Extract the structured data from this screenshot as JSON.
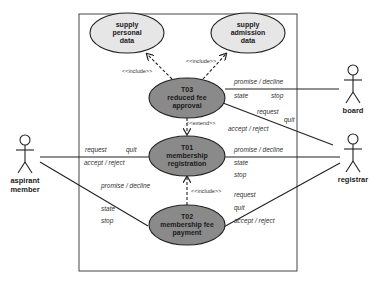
{
  "diagram": {
    "type": "uml-use-case",
    "colors": {
      "primary_use_case_fill": "#8a8a8a",
      "secondary_use_case_fill": "#e6e6e6",
      "line": "#222222",
      "boundary": "#444444"
    },
    "actors": [
      {
        "id": "aspirant",
        "name_line1": "aspirant",
        "name_line2": "member"
      },
      {
        "id": "board",
        "name_line1": "board"
      },
      {
        "id": "registrar",
        "name_line1": "registrar"
      }
    ],
    "use_cases": {
      "supply_personal": {
        "line1": "supply",
        "line2": "personal",
        "line3": "data"
      },
      "supply_admission": {
        "line1": "supply",
        "line2": "admission",
        "line3": "data"
      },
      "t03": {
        "line1": "T03",
        "line2": "reduced fee",
        "line3": "approval"
      },
      "t01": {
        "line1": "T01",
        "line2": "membership",
        "line3": "registration"
      },
      "t02": {
        "line1": "T02",
        "line2": "membership fee",
        "line3": "payment"
      }
    },
    "relations": {
      "include_personal": "<<include>>",
      "include_admission": "<<include>>",
      "extend_t03_t01": "<<extend>>",
      "include_t02_t01": "<<include>>"
    },
    "association_labels": {
      "aspirant_t01": {
        "top_left": "request",
        "top_right": "quit",
        "bottom": "accept / reject"
      },
      "aspirant_t02": {
        "a": "promise / decline",
        "b": "state",
        "c": "stop"
      },
      "board_t03": {
        "top": "promise / decline",
        "bottom_left": "state",
        "bottom_right": "stop"
      },
      "registrar_t03": {
        "a": "request",
        "b": "quit",
        "c": "accept / reject"
      },
      "registrar_t01": {
        "top": "promise / decline",
        "b": "state",
        "c": "stop"
      },
      "registrar_t02": {
        "a": "request",
        "b": "quit",
        "c": "accept / reject"
      }
    }
  }
}
